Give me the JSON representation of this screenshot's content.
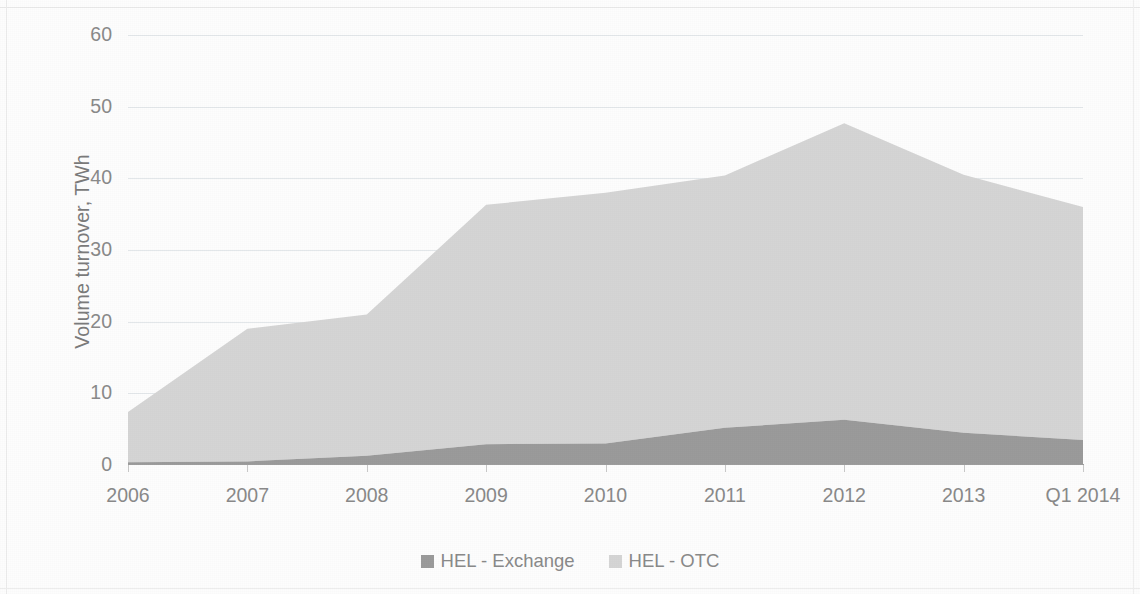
{
  "chart_data": {
    "type": "area",
    "stacked": true,
    "title": "",
    "subtitle": "",
    "xlabel": "",
    "ylabel": "Volume turnover, TWh",
    "categories": [
      "2006",
      "2007",
      "2008",
      "2009",
      "2010",
      "2011",
      "2012",
      "2013",
      "Q1 2014"
    ],
    "ylim": [
      0,
      60
    ],
    "ytick_values": [
      0,
      10,
      20,
      30,
      40,
      50,
      60
    ],
    "ytick_labels": [
      "0",
      "10",
      "20",
      "30",
      "40",
      "50",
      "60"
    ],
    "grid": true,
    "legend_position": "bottom",
    "series": [
      {
        "name": "HEL - Exchange",
        "color": "#9b9b9b",
        "values": [
          0.4,
          0.5,
          1.3,
          2.9,
          3.0,
          5.2,
          6.3,
          4.5,
          3.5
        ]
      },
      {
        "name": "HEL - OTC",
        "color": "#d5d5d5",
        "values": [
          7.0,
          18.5,
          19.7,
          33.4,
          35.0,
          35.2,
          41.4,
          36.0,
          32.5
        ]
      }
    ],
    "series_totals": [
      7.4,
      19.0,
      21.0,
      36.3,
      38.0,
      40.4,
      47.7,
      40.5,
      36.0
    ]
  },
  "axis": {
    "y_title": "Volume turnover, TWh"
  },
  "legend": {
    "items": [
      {
        "label": "HEL - Exchange",
        "color": "#9b9b9b",
        "marker": "square-swatch-icon"
      },
      {
        "label": "HEL - OTC",
        "color": "#d5d5d5",
        "marker": "square-swatch-icon"
      }
    ]
  },
  "colors": {
    "exchange": "#9b9b9b",
    "otc": "#d5d5d5",
    "gridline": "#e3e7ea",
    "axis": "#9d9d9d",
    "text": "#8a8a8a",
    "background": "#fdfdfd"
  }
}
